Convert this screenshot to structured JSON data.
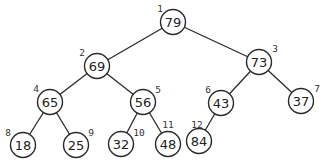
{
  "diagram": {
    "type": "binary-tree",
    "nodes": [
      {
        "index": "1",
        "value": "79",
        "cx": 173,
        "cy": 22,
        "lx": 160,
        "ly": 8
      },
      {
        "index": "2",
        "value": "69",
        "cx": 97,
        "cy": 66,
        "lx": 82,
        "ly": 52
      },
      {
        "index": "3",
        "value": "73",
        "cx": 259,
        "cy": 62,
        "lx": 275,
        "ly": 48
      },
      {
        "index": "4",
        "value": "65",
        "cx": 50,
        "cy": 102,
        "lx": 36,
        "ly": 88
      },
      {
        "index": "5",
        "value": "56",
        "cx": 143,
        "cy": 102,
        "lx": 158,
        "ly": 89
      },
      {
        "index": "6",
        "value": "43",
        "cx": 221,
        "cy": 103,
        "lx": 208,
        "ly": 89
      },
      {
        "index": "7",
        "value": "37",
        "cx": 301,
        "cy": 101,
        "lx": 317,
        "ly": 88
      },
      {
        "index": "8",
        "value": "18",
        "cx": 23,
        "cy": 145,
        "lx": 8,
        "ly": 132
      },
      {
        "index": "9",
        "value": "25",
        "cx": 76,
        "cy": 145,
        "lx": 91,
        "ly": 132
      },
      {
        "index": "10",
        "value": "32",
        "cx": 121,
        "cy": 144,
        "lx": 139,
        "ly": 132
      },
      {
        "index": "11",
        "value": "48",
        "cx": 168,
        "cy": 144,
        "lx": 168,
        "ly": 124
      },
      {
        "index": "12",
        "value": "84",
        "cx": 199,
        "cy": 141,
        "lx": 197,
        "ly": 124
      }
    ],
    "edges": [
      [
        "1",
        "2"
      ],
      [
        "1",
        "3"
      ],
      [
        "2",
        "4"
      ],
      [
        "2",
        "5"
      ],
      [
        "3",
        "6"
      ],
      [
        "3",
        "7"
      ],
      [
        "4",
        "8"
      ],
      [
        "4",
        "9"
      ],
      [
        "5",
        "10"
      ],
      [
        "5",
        "11"
      ],
      [
        "6",
        "12"
      ]
    ],
    "node_radius": 12.5,
    "colors": {
      "stroke": "#2a2a2a",
      "fill": "#ffffff",
      "text": "#222222"
    }
  }
}
